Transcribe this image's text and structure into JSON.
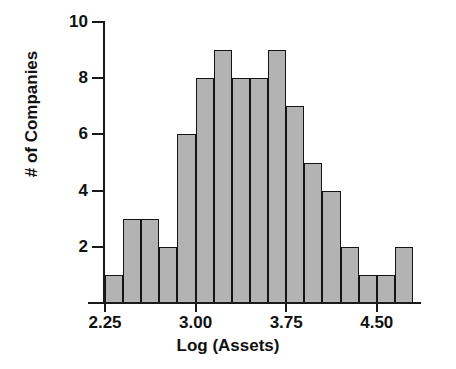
{
  "chart_data": {
    "type": "bar",
    "title": "",
    "xlabel": "Log (Assets)",
    "ylabel": "# of Companies",
    "grid": false,
    "legend": false,
    "bin_width": 0.15,
    "bin_start": 2.25,
    "bin_end": 4.8,
    "xlim": [
      2.1,
      4.95
    ],
    "ylim": [
      0,
      10
    ],
    "x_ticks": [
      2.25,
      3.0,
      3.75,
      4.5
    ],
    "x_tick_labels": [
      "2.25",
      "3.00",
      "3.75",
      "4.50"
    ],
    "y_ticks": [
      2,
      4,
      6,
      8,
      10
    ],
    "y_tick_labels": [
      "2",
      "4",
      "6",
      "8",
      "10"
    ],
    "bin_edges": [
      2.25,
      2.4,
      2.55,
      2.7,
      2.85,
      3.0,
      3.15,
      3.3,
      3.45,
      3.6,
      3.75,
      3.9,
      4.05,
      4.2,
      4.35,
      4.5,
      4.65,
      4.8
    ],
    "categories": [
      "2.25-2.40",
      "2.40-2.55",
      "2.55-2.70",
      "2.70-2.85",
      "2.85-3.00",
      "3.00-3.15",
      "3.15-3.30",
      "3.30-3.45",
      "3.45-3.60",
      "3.60-3.75",
      "3.75-3.90",
      "3.90-4.05",
      "4.05-4.20",
      "4.20-4.35",
      "4.35-4.50",
      "4.50-4.65",
      "4.65-4.80"
    ],
    "values": [
      1,
      3,
      3,
      2,
      6,
      8,
      9,
      8,
      8,
      9,
      7,
      5,
      4,
      2,
      1,
      1,
      2
    ],
    "total_count": 79,
    "bar_fill_color": "#b3b3b3",
    "bar_edge_color": "#141414",
    "background_color": "#ffffff",
    "axis_color": "#1a1a1a"
  }
}
